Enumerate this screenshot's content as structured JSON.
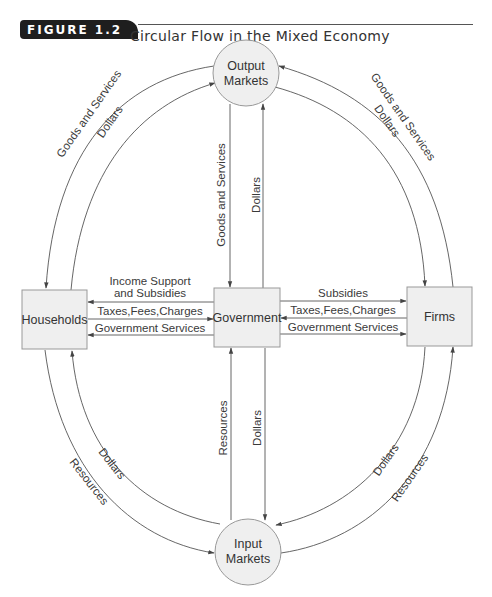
{
  "figure": {
    "number": "FIGURE 1.2",
    "title": "Circular Flow in the Mixed Economy"
  },
  "nodes": {
    "output_markets": [
      "Output",
      "Markets"
    ],
    "input_markets": [
      "Input",
      "Markets"
    ],
    "households": "Households",
    "government": "Government",
    "firms": "Firms"
  },
  "flows": {
    "households_to_output_goods": "Goods and Services",
    "households_to_output_dollars": "Dollars",
    "output_to_firms_goods": "Goods and Services",
    "output_to_firms_dollars": "Dollars",
    "output_to_gov_goods": "Goods and Services",
    "gov_to_output_dollars": "Dollars",
    "gov_to_households_income": [
      "Income Support",
      "and Subsidies"
    ],
    "households_to_gov_taxes": "Taxes,Fees,Charges",
    "gov_to_households_services": "Government Services",
    "gov_to_firms_subsidies": "Subsidies",
    "firms_to_gov_taxes": "Taxes,Fees,Charges",
    "gov_to_firms_services": "Government Services",
    "input_to_gov_resources": "Resources",
    "gov_to_input_dollars": "Dollars",
    "households_input_dollars": "Dollars",
    "households_input_resources": "Resources",
    "firms_input_dollars": "Dollars",
    "firms_input_resources": "Resources"
  },
  "colors": {
    "badge": "#1e1e1e",
    "node_fill": "#efefef",
    "node_stroke": "#999999",
    "line": "#555555"
  }
}
